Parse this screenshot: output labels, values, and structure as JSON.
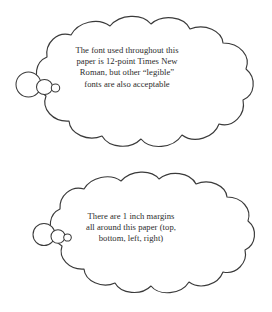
{
  "page": {
    "background_color": "#ffffff",
    "ink_color": "#3a3a3a",
    "text_color": "#2b2b2b"
  },
  "bubbles": [
    {
      "name": "font-requirement-bubble",
      "shape": "thought-cloud",
      "tail_direction": "left",
      "tail_bubble_count": 3,
      "lines": [
        "The font used throughout this",
        "paper is 12-point Times New",
        "Roman, but other “legible”",
        "fonts are also acceptable"
      ]
    },
    {
      "name": "margin-requirement-bubble",
      "shape": "thought-cloud",
      "tail_direction": "left",
      "tail_bubble_count": 3,
      "lines": [
        "There are 1 inch margins",
        "all around this paper (top,",
        "bottom, left, right)"
      ]
    }
  ]
}
